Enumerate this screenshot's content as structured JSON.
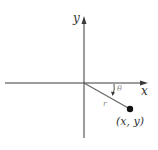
{
  "diagram": {
    "type": "polar-coordinates-figure",
    "axes": {
      "x_label": "x",
      "y_label": "y"
    },
    "labels": {
      "angle": "θ",
      "radius": "r",
      "point": "(x, y)"
    },
    "colors": {
      "axis": "#3a3a3a",
      "ray": "#555555",
      "label_gray": "#8a8a8a",
      "point": "#111111"
    }
  }
}
